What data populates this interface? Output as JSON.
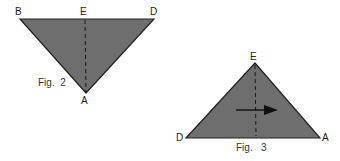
{
  "colors": {
    "fill": "#6e6e6e",
    "stroke": "#222222",
    "dash": "#1a1a1a"
  },
  "fig2": {
    "caption": "Fig.  2",
    "labels": {
      "B": "B",
      "E": "E",
      "D": "D",
      "A": "A"
    }
  },
  "fig3": {
    "caption": "Fig.   3",
    "labels": {
      "E": "E",
      "D": "D",
      "A": "A"
    },
    "arrow_direction": "right"
  }
}
